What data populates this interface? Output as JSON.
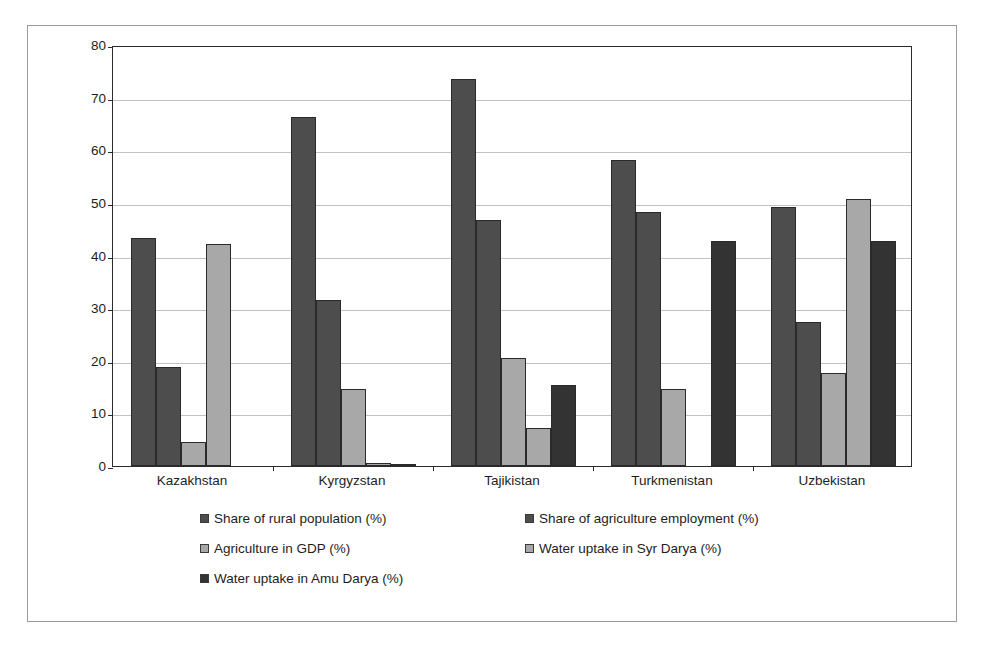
{
  "chart_data": {
    "type": "bar",
    "title": "",
    "subtitle": "",
    "xlabel": "",
    "ylabel": "",
    "ylim": [
      0,
      80
    ],
    "ytick_step": 10,
    "yticks": [
      0,
      10,
      20,
      30,
      40,
      50,
      60,
      70,
      80
    ],
    "grid": true,
    "grid_axis": "y",
    "legend_position": "bottom",
    "categories": [
      "Kazakhstan",
      "Kyrgyzstan",
      "Tajikistan",
      "Turkmenistan",
      "Uzbekistan"
    ],
    "series": [
      {
        "name": "Share of rural population (%)",
        "color": "#4d4d4d",
        "values": [
          43.3,
          66.3,
          73.5,
          58.1,
          49.3
        ]
      },
      {
        "name": "Share of agriculture employment (%)",
        "color": "#4d4d4d",
        "values": [
          18.8,
          31.6,
          46.8,
          48.2,
          27.3
        ]
      },
      {
        "name": "Agriculture in GDP (%)",
        "color": "#a8a8a8",
        "values": [
          4.5,
          14.6,
          20.5,
          14.6,
          17.7
        ]
      },
      {
        "name": "Water uptake in Syr Darya (%)",
        "color": "#a8a8a8",
        "values": [
          42.2,
          0.5,
          7.2,
          null,
          50.8
        ]
      },
      {
        "name": "Water uptake in Amu Darya (%)",
        "color": "#333333",
        "values": [
          null,
          0.3,
          15.4,
          42.7,
          42.7
        ]
      }
    ]
  },
  "legend": {
    "items": [
      {
        "label": "Share of rural population (%)",
        "color": "#4d4d4d"
      },
      {
        "label": "Share of agriculture employment (%)",
        "color": "#4d4d4d"
      },
      {
        "label": "Agriculture in GDP (%)",
        "color": "#a8a8a8"
      },
      {
        "label": "Water uptake in Syr Darya (%)",
        "color": "#a8a8a8"
      },
      {
        "label": "Water uptake in Amu Darya (%)",
        "color": "#333333"
      }
    ]
  }
}
